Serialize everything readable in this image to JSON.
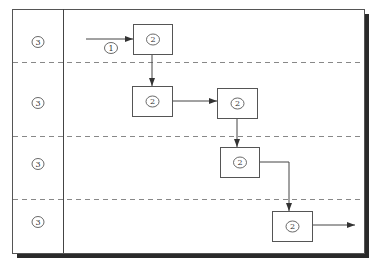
{
  "diagram": {
    "type": "swimlane-flow",
    "frame": {
      "x": 12,
      "y": 9,
      "w": 352,
      "h": 244,
      "shadow": 5,
      "shadow_color": "#2a2a2a",
      "border_color": "#555555"
    },
    "lane_divider_x": 63,
    "lane_separators_y": [
      62,
      136,
      199
    ],
    "lanes": [
      {
        "label": "3",
        "cy": 42
      },
      {
        "label": "3",
        "cy": 103
      },
      {
        "label": "3",
        "cy": 164
      },
      {
        "label": "3",
        "cy": 222
      }
    ],
    "lane_label_cx": 38,
    "boxes": [
      {
        "label": "2",
        "x": 133,
        "y": 24,
        "w": 39,
        "h": 30
      },
      {
        "label": "2",
        "x": 132,
        "y": 86,
        "w": 40,
        "h": 30
      },
      {
        "label": "2",
        "x": 217,
        "y": 88,
        "w": 40,
        "h": 30
      },
      {
        "label": "2",
        "x": 220,
        "y": 147,
        "w": 39,
        "h": 30
      },
      {
        "label": "2",
        "x": 272,
        "y": 211,
        "w": 40,
        "h": 30
      }
    ],
    "entry": {
      "label": "1",
      "label_cx": 111,
      "label_cy": 48
    },
    "connectors": [
      {
        "name": "entry-arrow",
        "points": [
          [
            86,
            39
          ],
          [
            133,
            39
          ]
        ]
      },
      {
        "name": "box1-to-box2",
        "points": [
          [
            152,
            54
          ],
          [
            152,
            86
          ]
        ]
      },
      {
        "name": "box2-to-box3",
        "points": [
          [
            172,
            101
          ],
          [
            217,
            101
          ]
        ]
      },
      {
        "name": "box3-to-box4",
        "points": [
          [
            237,
            118
          ],
          [
            237,
            147
          ]
        ]
      },
      {
        "name": "box4-to-box5",
        "points": [
          [
            259,
            162
          ],
          [
            289,
            162
          ],
          [
            289,
            211
          ]
        ]
      },
      {
        "name": "exit-arrow",
        "points": [
          [
            312,
            225
          ],
          [
            355,
            225
          ]
        ]
      }
    ]
  }
}
